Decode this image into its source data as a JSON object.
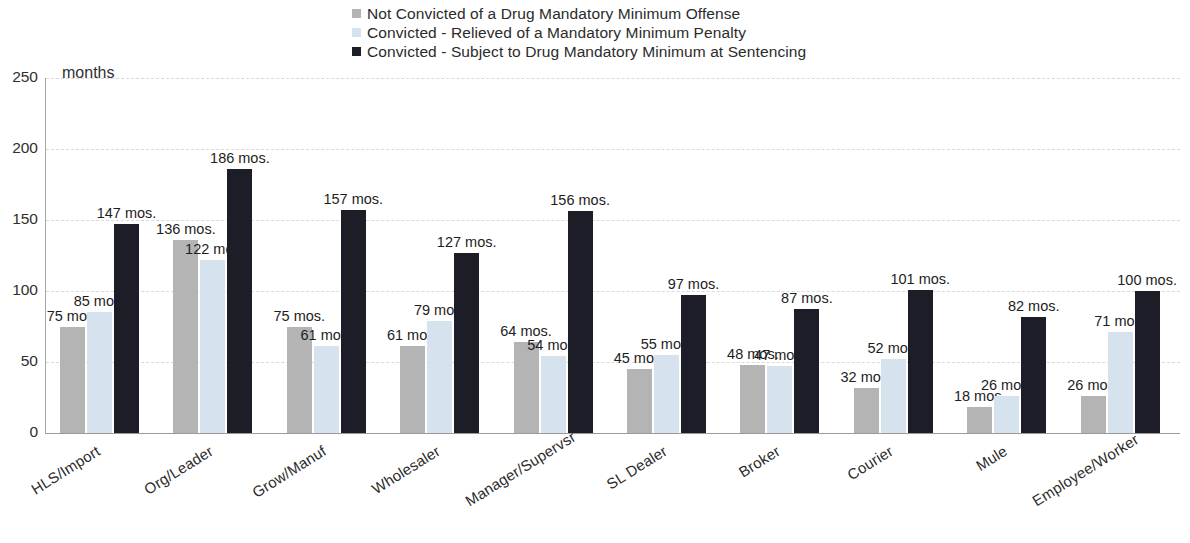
{
  "chart_data": {
    "type": "bar",
    "title": "",
    "subtitle": "",
    "xlabel": "",
    "ylabel": "months",
    "ylim": [
      0,
      250
    ],
    "yticks": [
      0,
      50,
      100,
      150,
      200,
      250
    ],
    "grid": true,
    "legend_position": "top-center",
    "value_suffix": " mos.",
    "categories": [
      "HLS/Import",
      "Org/Leader",
      "Grow/Manuf",
      "Wholesaler",
      "Manager/Supervsr",
      "SL Dealer",
      "Broker",
      "Courier",
      "Mule",
      "Employee/Worker"
    ],
    "series": [
      {
        "name": "Not Convicted of a Drug Mandatory Minimum Offense",
        "color": "#b4b4b4",
        "values": [
          75,
          136,
          75,
          61,
          64,
          45,
          48,
          32,
          18,
          26
        ],
        "labels": [
          "75 mos.",
          "136 mos.",
          "75 mos.",
          "61 mos.",
          "64 mos.",
          "45 mos.",
          "48 mos.",
          "32 mos.",
          "18 mos.",
          "26 mos."
        ]
      },
      {
        "name": "Convicted - Relieved of a Mandatory Minimum Penalty",
        "color": "#d6e3ef",
        "values": [
          85,
          122,
          61,
          79,
          54,
          55,
          47,
          52,
          26,
          71
        ],
        "labels": [
          "85 mos.",
          "122 mos",
          "61 mos.",
          "79 mos.",
          "54 mos.",
          "55 mos.",
          "47 mos.",
          "52 mos.",
          "26 mos.",
          "71 mos."
        ]
      },
      {
        "name": "Convicted - Subject to Drug Mandatory Minimum at Sentencing",
        "color": "#1d1d28",
        "values": [
          147,
          186,
          157,
          127,
          156,
          97,
          87,
          101,
          82,
          100
        ],
        "labels": [
          "147 mos.",
          "186 mos.",
          "157 mos.",
          "127 mos.",
          "156 mos.",
          "97 mos.",
          "87 mos.",
          "101 mos.",
          "82 mos.",
          "100 mos."
        ]
      }
    ]
  }
}
